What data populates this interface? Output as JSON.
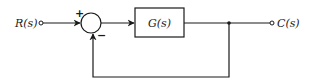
{
  "diagram": {
    "type": "block-diagram",
    "input": {
      "label": "R(s)"
    },
    "output": {
      "label": "C(s)"
    },
    "summing_junction": {
      "plus_sign": "+",
      "minus_sign": "−"
    },
    "forward_block": {
      "label": "G(s)"
    },
    "feedback": {
      "type": "unity",
      "sign": "negative"
    },
    "colors": {
      "line": "#1a1a1a",
      "background": "#ffffff"
    }
  }
}
